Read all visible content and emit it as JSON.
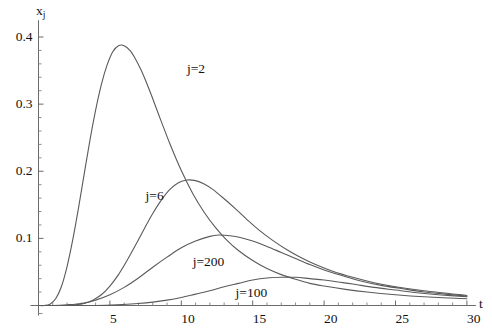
{
  "chart_data": {
    "type": "line",
    "title": "",
    "subtitle": "",
    "xlabel": "t",
    "ylabel": "x_j",
    "ylabel_base": "x",
    "ylabel_sub": "j",
    "xlim": [
      0,
      30
    ],
    "ylim": [
      0,
      0.42
    ],
    "grid": false,
    "legend_position": "inline-annotations",
    "x_ticks": [
      {
        "value": 5,
        "label": "5"
      },
      {
        "value": 10,
        "label": "10"
      },
      {
        "value": 15,
        "label": "15"
      },
      {
        "value": 20,
        "label": "20"
      },
      {
        "value": 25,
        "label": "25"
      },
      {
        "value": 30,
        "label": "30"
      }
    ],
    "x_minor_step": 1,
    "y_ticks": [
      {
        "value": 0.1,
        "label": "0.1"
      },
      {
        "value": 0.2,
        "label": "0.2"
      },
      {
        "value": 0.3,
        "label": "0.3"
      },
      {
        "value": 0.4,
        "label": "0.4"
      }
    ],
    "y_minor_step": 0.02,
    "series": [
      {
        "name": "j=2",
        "label": "j=2",
        "label_x": 10.4,
        "label_y": 0.352,
        "peak": {
          "t": 5.4,
          "x": 0.387
        },
        "points": [
          [
            0.0,
            0.0
          ],
          [
            0.4,
            0.0
          ],
          [
            0.8,
            0.002
          ],
          [
            1.2,
            0.01
          ],
          [
            1.6,
            0.028
          ],
          [
            2.0,
            0.058
          ],
          [
            2.4,
            0.098
          ],
          [
            2.8,
            0.145
          ],
          [
            3.2,
            0.196
          ],
          [
            3.6,
            0.246
          ],
          [
            4.0,
            0.291
          ],
          [
            4.4,
            0.329
          ],
          [
            4.8,
            0.358
          ],
          [
            5.2,
            0.378
          ],
          [
            5.6,
            0.387
          ],
          [
            6.0,
            0.387
          ],
          [
            6.4,
            0.38
          ],
          [
            6.8,
            0.367
          ],
          [
            7.2,
            0.35
          ],
          [
            7.6,
            0.33
          ],
          [
            8.0,
            0.308
          ],
          [
            8.6,
            0.274
          ],
          [
            9.2,
            0.241
          ],
          [
            10.0,
            0.201
          ],
          [
            10.8,
            0.167
          ],
          [
            11.6,
            0.139
          ],
          [
            12.4,
            0.116
          ],
          [
            13.2,
            0.097
          ],
          [
            14.0,
            0.082
          ],
          [
            15.0,
            0.067
          ],
          [
            16.0,
            0.055
          ],
          [
            17.0,
            0.046
          ],
          [
            18.0,
            0.039
          ],
          [
            19.0,
            0.033
          ],
          [
            20.0,
            0.029
          ],
          [
            21.5,
            0.024
          ],
          [
            23.0,
            0.02
          ],
          [
            25.0,
            0.016
          ],
          [
            27.0,
            0.013
          ],
          [
            30.0,
            0.01
          ]
        ]
      },
      {
        "name": "j=6",
        "label": "j=6",
        "label_x": 7.5,
        "label_y": 0.163,
        "peak": {
          "t": 8.9,
          "x": 0.187
        },
        "points": [
          [
            0.0,
            0.0
          ],
          [
            1.0,
            0.0
          ],
          [
            2.0,
            0.0
          ],
          [
            2.6,
            0.001
          ],
          [
            3.2,
            0.003
          ],
          [
            3.8,
            0.008
          ],
          [
            4.4,
            0.016
          ],
          [
            5.0,
            0.029
          ],
          [
            5.6,
            0.046
          ],
          [
            6.2,
            0.067
          ],
          [
            6.8,
            0.09
          ],
          [
            7.4,
            0.114
          ],
          [
            8.0,
            0.137
          ],
          [
            8.6,
            0.157
          ],
          [
            9.2,
            0.173
          ],
          [
            9.8,
            0.183
          ],
          [
            10.4,
            0.187
          ],
          [
            11.0,
            0.186
          ],
          [
            11.6,
            0.181
          ],
          [
            12.2,
            0.173
          ],
          [
            13.0,
            0.159
          ],
          [
            13.8,
            0.144
          ],
          [
            14.6,
            0.128
          ],
          [
            15.4,
            0.113
          ],
          [
            16.4,
            0.097
          ],
          [
            17.4,
            0.083
          ],
          [
            18.4,
            0.071
          ],
          [
            19.4,
            0.061
          ],
          [
            20.6,
            0.051
          ],
          [
            22.0,
            0.042
          ],
          [
            23.5,
            0.034
          ],
          [
            25.0,
            0.028
          ],
          [
            27.0,
            0.022
          ],
          [
            30.0,
            0.015
          ]
        ]
      },
      {
        "name": "j=200",
        "label": "j=200",
        "label_x": 10.8,
        "label_y": 0.065,
        "peak": {
          "t": 12.5,
          "x": 0.105
        },
        "points": [
          [
            0.0,
            0.0
          ],
          [
            1.0,
            0.0
          ],
          [
            2.0,
            0.001
          ],
          [
            3.0,
            0.003
          ],
          [
            4.0,
            0.008
          ],
          [
            5.0,
            0.016
          ],
          [
            6.0,
            0.027
          ],
          [
            7.0,
            0.041
          ],
          [
            8.0,
            0.057
          ],
          [
            9.0,
            0.072
          ],
          [
            10.0,
            0.086
          ],
          [
            11.0,
            0.096
          ],
          [
            12.0,
            0.103
          ],
          [
            12.6,
            0.105
          ],
          [
            13.4,
            0.104
          ],
          [
            14.2,
            0.101
          ],
          [
            15.0,
            0.096
          ],
          [
            16.0,
            0.088
          ],
          [
            17.0,
            0.079
          ],
          [
            18.0,
            0.07
          ],
          [
            19.0,
            0.061
          ],
          [
            20.0,
            0.053
          ],
          [
            21.2,
            0.045
          ],
          [
            22.5,
            0.037
          ],
          [
            24.0,
            0.03
          ],
          [
            25.5,
            0.025
          ],
          [
            27.0,
            0.02
          ],
          [
            28.5,
            0.017
          ],
          [
            30.0,
            0.014
          ]
        ]
      },
      {
        "name": "j=100",
        "label": "j=100",
        "label_x": 13.8,
        "label_y": 0.019,
        "peak": {
          "t": 16.5,
          "x": 0.042
        },
        "points": [
          [
            0.0,
            0.0
          ],
          [
            2.0,
            0.0
          ],
          [
            4.0,
            0.0
          ],
          [
            5.5,
            0.001
          ],
          [
            7.0,
            0.003
          ],
          [
            8.0,
            0.005
          ],
          [
            9.0,
            0.008
          ],
          [
            10.0,
            0.012
          ],
          [
            11.0,
            0.017
          ],
          [
            12.0,
            0.022
          ],
          [
            13.0,
            0.028
          ],
          [
            14.0,
            0.033
          ],
          [
            15.0,
            0.038
          ],
          [
            16.0,
            0.041
          ],
          [
            17.0,
            0.042
          ],
          [
            18.0,
            0.042
          ],
          [
            19.0,
            0.04
          ],
          [
            20.0,
            0.038
          ],
          [
            21.0,
            0.035
          ],
          [
            22.0,
            0.032
          ],
          [
            23.5,
            0.027
          ],
          [
            25.0,
            0.023
          ],
          [
            26.5,
            0.019
          ],
          [
            28.0,
            0.016
          ],
          [
            30.0,
            0.013
          ]
        ]
      }
    ]
  },
  "axes": {
    "y_label_base": "x",
    "y_label_sub": "j",
    "x_label": "t"
  },
  "style": {
    "curve_color": "#5a5a5a",
    "axis_color": "#6b6b6b",
    "text_color": "#111111",
    "background": "#ffffff"
  }
}
